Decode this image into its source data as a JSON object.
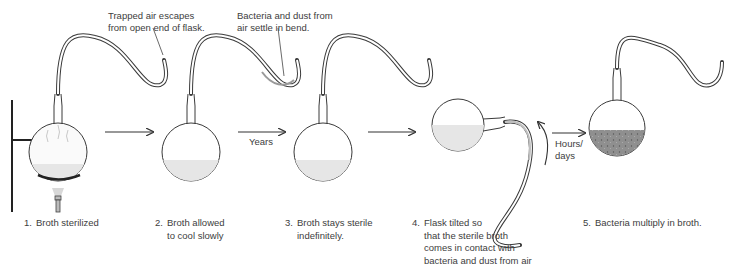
{
  "callouts": {
    "trapped_air": "Trapped air escapes\nfrom open end of flask.",
    "bacteria_dust": "Bacteria and dust from\nair settle in bend."
  },
  "transitions": [
    {
      "from": 1,
      "to": 2,
      "label": ""
    },
    {
      "from": 2,
      "to": 3,
      "label": "Years"
    },
    {
      "from": 3,
      "to": 4,
      "label": ""
    },
    {
      "from": 4,
      "to": 5,
      "label": "Hours/\ndays"
    }
  ],
  "steps": [
    {
      "number": "1.",
      "text": "Broth sterilized"
    },
    {
      "number": "2.",
      "text": "Broth allowed\nto cool slowly"
    },
    {
      "number": "3.",
      "text": "Broth stays sterile\nindefinitely."
    },
    {
      "number": "4.",
      "text": "Flask tilted so\nthat the sterile broth\ncomes in contact with\nbacteria and dust from air"
    },
    {
      "number": "5.",
      "text": "Bacteria multiply in broth."
    }
  ],
  "colors": {
    "outline": "#3a3a3a",
    "broth_sterile": "#e6e6e6",
    "broth_contaminated": "#8f8f8f",
    "dust": "#9a9a9a"
  }
}
